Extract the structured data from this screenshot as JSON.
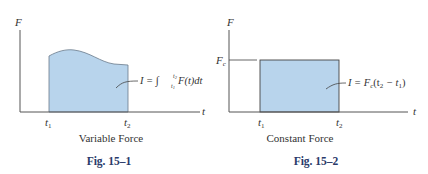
{
  "colors": {
    "fill": "#b8d4ec",
    "fill_edge": "#5a6a7a",
    "axis": "#555555",
    "caption": "#2a3a6a"
  },
  "figures": [
    {
      "id": "fig-15-1",
      "y_axis_label": "F",
      "x_axis_label": "t",
      "t1_label": "t",
      "t1_sub": "1",
      "t2_label": "t",
      "t2_sub": "2",
      "equation": {
        "lhs": "I = ",
        "integral": "∫",
        "upper": "t",
        "upper_sub": "2",
        "lower": "t",
        "lower_sub": "1",
        "rhs": " F(t)dt"
      },
      "subtitle": "Variable Force",
      "caption": "Fig. 15–1"
    },
    {
      "id": "fig-15-2",
      "y_axis_label": "F",
      "x_axis_label": "t",
      "level_label": "F",
      "level_sub": "c",
      "t1_label": "t",
      "t1_sub": "1",
      "t2_label": "t",
      "t2_sub": "2",
      "equation": {
        "lhs": "I = F",
        "lhs_sub": "c",
        "paren_open": "(t",
        "a_sub": "2",
        "minus": " − t",
        "b_sub": "1",
        "paren_close": ")"
      },
      "subtitle": "Constant Force",
      "caption": "Fig. 15–2"
    }
  ]
}
